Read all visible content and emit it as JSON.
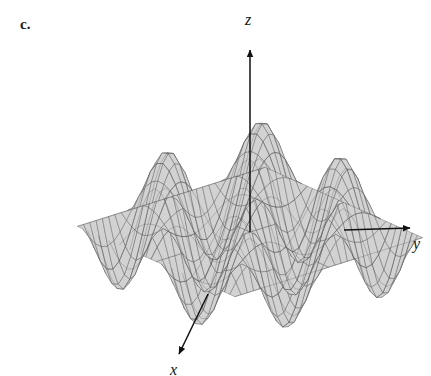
{
  "figure": {
    "panel_label": "c.",
    "background_color": "#ffffff",
    "surface_fill": "#d2d2d2",
    "mesh_line_color": "#4a4a4a",
    "axis_color": "#111111",
    "label_color": "#141414"
  },
  "axes": {
    "z": {
      "label": "z",
      "direction": "up"
    },
    "y": {
      "label": "y",
      "direction": "right"
    },
    "x": {
      "label": "x",
      "direction": "down-left"
    }
  },
  "chart_data": {
    "type": "surface",
    "title": "",
    "subtitle": "",
    "annotations": [
      "c."
    ],
    "function": "z = sin(x) * sin(y)",
    "xlabel": "x",
    "ylabel": "y",
    "zlabel": "z",
    "xlim": [
      -6.2832,
      6.2832
    ],
    "ylim": [
      -6.2832,
      6.2832
    ],
    "zlim": [
      -1,
      1
    ],
    "grid": true,
    "legend": null,
    "amplitude": 1,
    "x_period": 6.2832,
    "y_period": 6.2832,
    "peaks_visible": 6,
    "valleys_visible": 6,
    "mesh_rows": 30,
    "mesh_cols": 30,
    "projection": {
      "type": "axonometric",
      "azimuth_deg": 40,
      "elevation_deg": 22,
      "scale_x": 19.5,
      "scale_y": 19.5,
      "scale_z": 62,
      "origin_px": [
        250,
        232
      ]
    },
    "axis_arrows": [
      {
        "name": "z",
        "from_px": [
          250,
          232
        ],
        "to_px": [
          250,
          47
        ],
        "label_px": [
          248,
          20
        ]
      },
      {
        "name": "y",
        "from_px": [
          250,
          232
        ],
        "to_px": [
          416,
          228
        ],
        "label_px": [
          416,
          244
        ]
      },
      {
        "name": "x",
        "from_px": [
          250,
          232
        ],
        "to_px": [
          176,
          360
        ],
        "label_px": [
          172,
          370
        ]
      }
    ]
  }
}
